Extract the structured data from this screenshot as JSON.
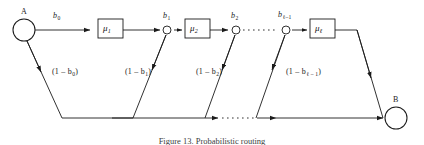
{
  "figure": {
    "caption": "Figure 13. Probabilistic routing",
    "nodes": {
      "source_label": "A",
      "sink_label": "B"
    },
    "branch_labels": [
      {
        "name": "b0",
        "base": "b",
        "sub": "0",
        "x": 53,
        "y": 12
      },
      {
        "name": "b1",
        "base": "b",
        "sub": "1",
        "x": 163,
        "y": 12
      },
      {
        "name": "b2",
        "base": "b",
        "sub": "2",
        "x": 224,
        "y": 12
      },
      {
        "name": "b-ell-minus-1",
        "base": "b",
        "sub": "ℓ–1",
        "x": 281,
        "y": 11
      }
    ],
    "service_boxes": [
      {
        "name": "mu1",
        "base": "μ",
        "sub": "1",
        "x": 98,
        "y": 19,
        "w": 25,
        "h": 19
      },
      {
        "name": "mu2",
        "base": "μ",
        "sub": "2",
        "x": 185,
        "y": 19,
        "w": 25,
        "h": 19
      },
      {
        "name": "mu-ell",
        "base": "μ",
        "sub": "ℓ",
        "x": 310,
        "y": 19,
        "w": 25,
        "h": 19
      }
    ],
    "complement_labels": [
      {
        "name": "one-minus-b0",
        "text": "(1 – b",
        "sub": "0",
        "tail": ")",
        "x": 52,
        "y": 68
      },
      {
        "name": "one-minus-b1",
        "text": "(1 – b",
        "sub": "1",
        "tail": ")",
        "x": 125,
        "y": 68
      },
      {
        "name": "one-minus-b2",
        "text": "(1 – b",
        "sub": "2",
        "tail": ")",
        "x": 196,
        "y": 68
      },
      {
        "name": "one-minus-b-ell-minus-1",
        "text": "(1 – b",
        "sub": "ℓ – 1",
        "tail": ")",
        "x": 286,
        "y": 68
      }
    ],
    "colors": {
      "stroke": "#1b1b1b",
      "background": "#ffffff",
      "caption": "#3c3c3c"
    }
  }
}
